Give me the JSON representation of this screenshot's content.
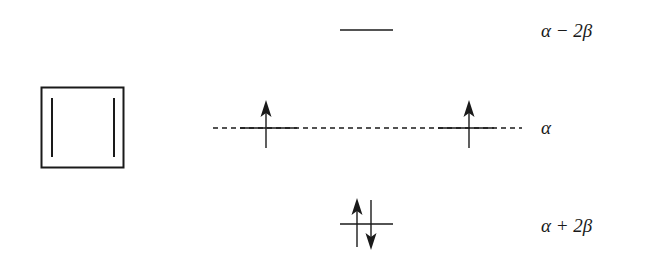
{
  "diagram": {
    "molecule": {
      "name": "cyclobutadiene",
      "ring_size": 4,
      "double_bonds": 2
    },
    "line_color": "#1a1a1a",
    "levels": [
      {
        "id": "antibonding",
        "energy_label": "α − 2β",
        "label_parts": [
          "α",
          " − ",
          "2β"
        ],
        "degeneracy": 1,
        "orbitals": [
          {
            "electrons": []
          }
        ]
      },
      {
        "id": "nonbonding",
        "energy_label": "α",
        "label_parts": [
          "α"
        ],
        "degeneracy": 2,
        "reference_line": "dashed",
        "orbitals": [
          {
            "electrons": [
              "up"
            ]
          },
          {
            "electrons": [
              "up"
            ]
          }
        ]
      },
      {
        "id": "bonding",
        "energy_label": "α + 2β",
        "label_parts": [
          "α",
          " + ",
          "2β"
        ],
        "degeneracy": 1,
        "orbitals": [
          {
            "electrons": [
              "up",
              "down"
            ]
          }
        ]
      }
    ],
    "total_pi_electrons": 4
  }
}
